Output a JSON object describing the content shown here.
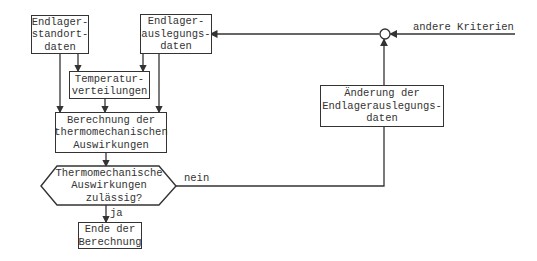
{
  "diagram": {
    "type": "flowchart",
    "nodes": {
      "standort": {
        "lines": [
          "Endlager-",
          "standort-",
          "daten"
        ]
      },
      "auslegung": {
        "lines": [
          "Endlager-",
          "auslegungs-",
          "daten"
        ]
      },
      "temperatur": {
        "lines": [
          "Temperatur-",
          "verteilungen"
        ]
      },
      "berechnung": {
        "lines": [
          "Berechnung der",
          "thermomechanischen",
          "Auswirkungen"
        ]
      },
      "entscheidung": {
        "lines": [
          "Thermomechanische",
          "Auswirkungen",
          "zulässig?"
        ]
      },
      "ende": {
        "lines": [
          "Ende der",
          "Berechnung"
        ]
      },
      "aenderung": {
        "lines": [
          "Änderung der",
          "Endlagerauslegungs-",
          "daten"
        ]
      }
    },
    "edge_labels": {
      "nein": "nein",
      "ja": "ja",
      "andere_kriterien": "andere Kriterien"
    },
    "colors": {
      "stroke": "#333333",
      "background": "#ffffff"
    }
  }
}
